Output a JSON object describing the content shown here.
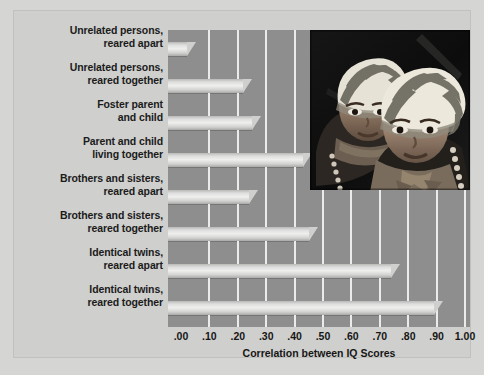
{
  "chart_data": {
    "type": "bar",
    "orientation": "horizontal",
    "title": "",
    "xlabel": "Correlation between IQ Scores",
    "ylabel": "",
    "xlim": [
      0.0,
      1.0
    ],
    "xticks": [
      ".00",
      ".10",
      ".20",
      ".30",
      ".40",
      ".50",
      ".60",
      ".70",
      ".80",
      ".90",
      "1.00"
    ],
    "xtick_values": [
      0.0,
      0.1,
      0.2,
      0.3,
      0.4,
      0.5,
      0.6,
      0.7,
      0.8,
      0.9,
      1.0
    ],
    "grid": false,
    "legend": "none",
    "categories": [
      "Unrelated persons,\nreared apart",
      "Unrelated persons,\nreared together",
      "Foster parent\nand child",
      "Parent and child\nliving together",
      "Brothers and sisters,\nreared apart",
      "Brothers and sisters,\nreared together",
      "Identical twins,\nreared apart",
      "Identical twins,\nreared together"
    ],
    "values": [
      0.02,
      0.22,
      0.25,
      0.43,
      0.24,
      0.45,
      0.74,
      0.89
    ]
  },
  "bars": [
    {
      "line1": "Unrelated persons,",
      "line2": "reared apart",
      "value": 0.02
    },
    {
      "line1": "Unrelated persons,",
      "line2": "reared together",
      "value": 0.22
    },
    {
      "line1": "Foster parent",
      "line2": "and child",
      "value": 0.25
    },
    {
      "line1": "Parent and child",
      "line2": "living together",
      "value": 0.43
    },
    {
      "line1": "Brothers and sisters,",
      "line2": "reared apart",
      "value": 0.24
    },
    {
      "line1": "Brothers and sisters,",
      "line2": "reared together",
      "value": 0.45
    },
    {
      "line1": "Identical twins,",
      "line2": "reared apart",
      "value": 0.74
    },
    {
      "line1": "Identical twins,",
      "line2": "reared together",
      "value": 0.89
    }
  ],
  "axis": {
    "ticks": [
      ".00",
      ".10",
      ".20",
      ".30",
      ".40",
      ".50",
      ".60",
      ".70",
      ".80",
      ".90",
      "1.00"
    ],
    "label": "Correlation between IQ Scores"
  },
  "photo": {
    "name": "twin-children-photo",
    "description": "Photograph of two young twin children wearing striped head wraps"
  },
  "colors": {
    "plot_background": "#8e8e8e",
    "panel_background": "#cfcfcd",
    "page_background": "#d5d5d3",
    "bar_highlight": "#efefee",
    "bar_shadow": "#a9a9a8",
    "tick_line": "#ebebea",
    "text": "#1b1b1b"
  }
}
